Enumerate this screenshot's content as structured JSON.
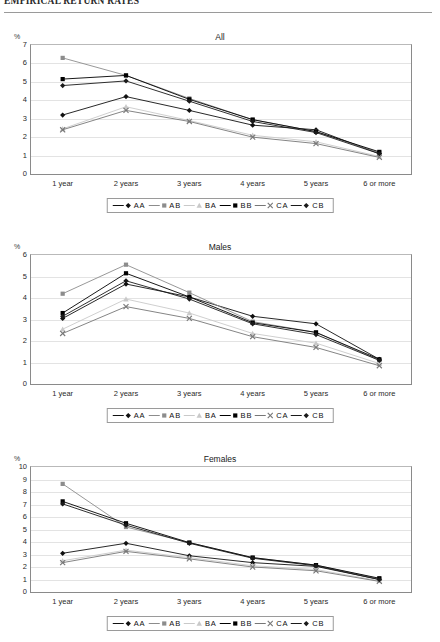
{
  "header": {
    "title": "EMPIRICAL RETURN RATES"
  },
  "axis": {
    "y_unit": "%",
    "categories": [
      "1 year",
      "2 years",
      "3 years",
      "4 years",
      "5 years",
      "6 or more"
    ]
  },
  "legend": {
    "items": [
      {
        "label": "AA",
        "marker": "diamond",
        "color": "#111111"
      },
      {
        "label": "AB",
        "marker": "square",
        "color": "#8c8c8c"
      },
      {
        "label": "BA",
        "marker": "triangle",
        "color": "#c9c9c9"
      },
      {
        "label": "BB",
        "marker": "square",
        "color": "#000000"
      },
      {
        "label": "CA",
        "marker": "cross",
        "color": "#777777"
      },
      {
        "label": "CB",
        "marker": "diamond",
        "color": "#1a1a1a"
      }
    ]
  },
  "charts": [
    {
      "id": "all",
      "title": "All"
    },
    {
      "id": "males",
      "title": "Males"
    },
    {
      "id": "females",
      "title": "Females"
    }
  ],
  "chart_data": [
    {
      "type": "line",
      "title": "All",
      "xlabel": "",
      "ylabel": "%",
      "ylim": [
        0,
        7
      ],
      "yticks": [
        0,
        1,
        2,
        3,
        4,
        5,
        6,
        7
      ],
      "grid": true,
      "legend_position": "bottom",
      "categories": [
        "1 year",
        "2 years",
        "3 years",
        "4 years",
        "5 years",
        "6 or more"
      ],
      "series": [
        {
          "name": "AA",
          "values": [
            3.2,
            4.2,
            3.45,
            2.65,
            2.4,
            1.1
          ]
        },
        {
          "name": "AB",
          "values": [
            6.3,
            5.35,
            4.1,
            2.95,
            2.3,
            1.15
          ]
        },
        {
          "name": "BA",
          "values": [
            2.45,
            3.65,
            2.9,
            2.1,
            1.75,
            0.95
          ]
        },
        {
          "name": "BB",
          "values": [
            5.15,
            5.35,
            4.05,
            2.95,
            2.3,
            1.2
          ]
        },
        {
          "name": "CA",
          "values": [
            2.4,
            3.45,
            2.85,
            2.0,
            1.65,
            0.9
          ]
        },
        {
          "name": "CB",
          "values": [
            4.8,
            5.05,
            3.95,
            2.85,
            2.25,
            1.1
          ]
        }
      ]
    },
    {
      "type": "line",
      "title": "Males",
      "xlabel": "",
      "ylabel": "%",
      "ylim": [
        0,
        6
      ],
      "yticks": [
        0,
        1,
        2,
        3,
        4,
        5,
        6
      ],
      "grid": true,
      "legend_position": "bottom",
      "categories": [
        "1 year",
        "2 years",
        "3 years",
        "4 years",
        "5 years",
        "6 or more"
      ],
      "series": [
        {
          "name": "AA",
          "values": [
            3.05,
            4.65,
            4.05,
            3.15,
            2.8,
            1.15
          ]
        },
        {
          "name": "AB",
          "values": [
            4.2,
            5.55,
            4.25,
            2.9,
            2.4,
            1.1
          ]
        },
        {
          "name": "BA",
          "values": [
            2.55,
            3.95,
            3.3,
            2.35,
            1.9,
            0.95
          ]
        },
        {
          "name": "BB",
          "values": [
            3.3,
            5.15,
            4.05,
            2.85,
            2.4,
            1.15
          ]
        },
        {
          "name": "CA",
          "values": [
            2.35,
            3.6,
            3.05,
            2.2,
            1.7,
            0.85
          ]
        },
        {
          "name": "CB",
          "values": [
            3.15,
            4.8,
            3.95,
            2.8,
            2.3,
            1.1
          ]
        }
      ]
    },
    {
      "type": "line",
      "title": "Females",
      "xlabel": "",
      "ylabel": "%",
      "ylim": [
        0,
        10
      ],
      "yticks": [
        0,
        1,
        2,
        3,
        4,
        5,
        6,
        7,
        8,
        9,
        10
      ],
      "grid": true,
      "legend_position": "bottom",
      "categories": [
        "1 year",
        "2 years",
        "3 years",
        "4 years",
        "5 years",
        "6 or more"
      ],
      "series": [
        {
          "name": "AA",
          "values": [
            3.1,
            3.9,
            2.9,
            2.35,
            2.05,
            1.0
          ]
        },
        {
          "name": "AB",
          "values": [
            8.65,
            5.2,
            3.95,
            2.75,
            2.15,
            1.05
          ]
        },
        {
          "name": "BA",
          "values": [
            2.5,
            3.35,
            2.75,
            2.1,
            1.8,
            0.9
          ]
        },
        {
          "name": "BB",
          "values": [
            7.25,
            5.5,
            3.95,
            2.75,
            2.15,
            1.1
          ]
        },
        {
          "name": "CA",
          "values": [
            2.35,
            3.25,
            2.65,
            2.0,
            1.7,
            0.85
          ]
        },
        {
          "name": "CB",
          "values": [
            7.05,
            5.35,
            3.9,
            2.7,
            2.1,
            1.0
          ]
        }
      ]
    }
  ]
}
